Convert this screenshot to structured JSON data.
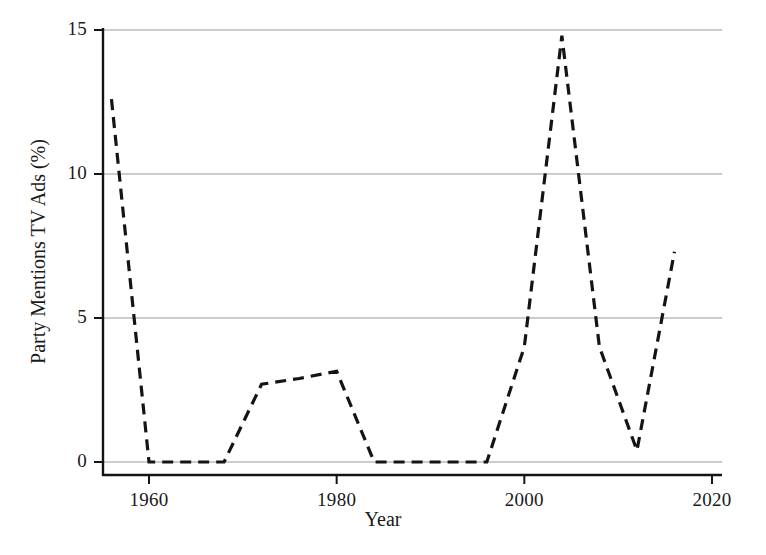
{
  "chart_data": {
    "type": "line",
    "title": "",
    "xlabel": "Year",
    "ylabel": "Party Mentions TV Ads (%)",
    "xlim": [
      1955,
      2022
    ],
    "ylim": [
      -0.45,
      15.4
    ],
    "xticks": [
      1960,
      1980,
      2000,
      2020
    ],
    "xtick_labels": [
      "1960",
      "1980",
      "2000",
      "2020"
    ],
    "yticks": [
      0,
      5,
      10,
      15
    ],
    "ytick_labels": [
      "0",
      "5",
      "10",
      "15"
    ],
    "grid": "horizontal",
    "legend": "none",
    "line_color": "#141414",
    "line_style": "dashed",
    "line_width": 3.2,
    "series": [
      {
        "name": "Party Mentions TV Ads",
        "x": [
          1956,
          1960,
          1964,
          1968,
          1972,
          1976,
          1980,
          1984,
          1988,
          1992,
          1996,
          2000,
          2004,
          2008,
          2012,
          2016
        ],
        "values": [
          12.6,
          0.0,
          0.0,
          0.0,
          2.7,
          2.9,
          3.15,
          0.0,
          0.0,
          0.0,
          0.0,
          4.0,
          14.8,
          4.0,
          0.4,
          7.3
        ]
      }
    ]
  },
  "axes": {
    "left_px": 103,
    "right_px": 722,
    "top_px": 30,
    "bottom_px": 475,
    "zero_px": 462
  }
}
